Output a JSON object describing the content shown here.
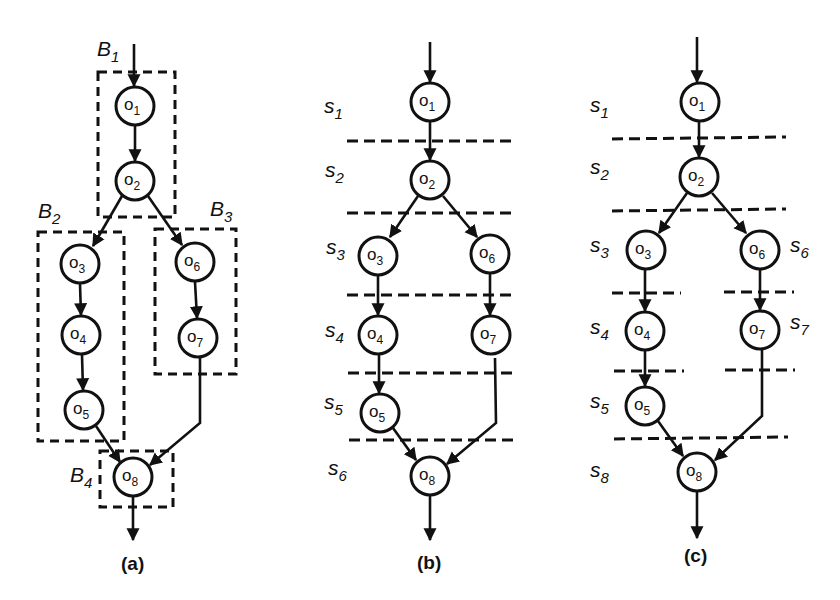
{
  "figure": {
    "panels": [
      {
        "id": "a",
        "caption": "(a)",
        "nodes": [
          {
            "id": "o1",
            "base": "o",
            "sub": "1"
          },
          {
            "id": "o2",
            "base": "o",
            "sub": "2"
          },
          {
            "id": "o3",
            "base": "o",
            "sub": "3"
          },
          {
            "id": "o4",
            "base": "o",
            "sub": "4"
          },
          {
            "id": "o5",
            "base": "o",
            "sub": "5"
          },
          {
            "id": "o6",
            "base": "o",
            "sub": "6"
          },
          {
            "id": "o7",
            "base": "o",
            "sub": "7"
          },
          {
            "id": "o8",
            "base": "o",
            "sub": "8"
          }
        ],
        "groups": [
          {
            "base": "B",
            "sub": "1",
            "members": [
              "o1",
              "o2"
            ]
          },
          {
            "base": "B",
            "sub": "2",
            "members": [
              "o3",
              "o4",
              "o5"
            ]
          },
          {
            "base": "B",
            "sub": "3",
            "members": [
              "o6",
              "o7"
            ]
          },
          {
            "base": "B",
            "sub": "4",
            "members": [
              "o8"
            ]
          }
        ]
      },
      {
        "id": "b",
        "caption": "(b)",
        "stages": [
          {
            "base": "s",
            "sub": "1"
          },
          {
            "base": "s",
            "sub": "2"
          },
          {
            "base": "s",
            "sub": "3"
          },
          {
            "base": "s",
            "sub": "4"
          },
          {
            "base": "s",
            "sub": "5"
          },
          {
            "base": "s",
            "sub": "6"
          }
        ]
      },
      {
        "id": "c",
        "caption": "(c)",
        "stages": [
          {
            "base": "s",
            "sub": "1"
          },
          {
            "base": "s",
            "sub": "2"
          },
          {
            "base": "s",
            "sub": "3"
          },
          {
            "base": "s",
            "sub": "4"
          },
          {
            "base": "s",
            "sub": "5"
          },
          {
            "base": "s",
            "sub": "6"
          },
          {
            "base": "s",
            "sub": "7"
          },
          {
            "base": "s",
            "sub": "8"
          }
        ]
      }
    ],
    "edges": [
      [
        "in",
        "o1"
      ],
      [
        "o1",
        "o2"
      ],
      [
        "o2",
        "o3"
      ],
      [
        "o2",
        "o6"
      ],
      [
        "o3",
        "o4"
      ],
      [
        "o4",
        "o5"
      ],
      [
        "o6",
        "o7"
      ],
      [
        "o5",
        "o8"
      ],
      [
        "o7",
        "o8"
      ],
      [
        "o8",
        "out"
      ]
    ]
  }
}
